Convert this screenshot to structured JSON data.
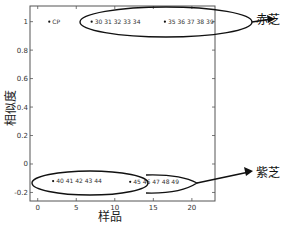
{
  "chart_data": {
    "type": "scatter",
    "title": "",
    "xlabel": "样品",
    "ylabel": "相似度",
    "xlim": [
      -1,
      23
    ],
    "ylim": [
      -0.26,
      1.11
    ],
    "xticks": [
      0,
      5,
      10,
      15,
      20
    ],
    "yticks": [
      -0.2,
      0,
      0.2,
      0.4,
      0.6,
      0.8,
      1
    ],
    "ytick_labels": [
      "-0.2",
      "0",
      "0.2",
      "0.4",
      "0.6",
      "0.8",
      "1"
    ],
    "grid": false,
    "legend": null,
    "points": [
      {
        "x": 1.5,
        "y": 1.0,
        "label": "CP"
      },
      {
        "x": 7,
        "y": 1.0,
        "label": "30 31 32 33 34"
      },
      {
        "x": 16.5,
        "y": 1.0,
        "label": "35 36 37 38 39"
      },
      {
        "x": 2,
        "y": -0.12,
        "label": "40 41 42 43 44"
      },
      {
        "x": 12,
        "y": -0.125,
        "label": "45 46 47 48 49"
      }
    ],
    "groups": [
      {
        "name": "赤芝",
        "members": [
          "30",
          "31",
          "32",
          "33",
          "34",
          "35",
          "36",
          "37",
          "38",
          "39"
        ],
        "y": 1.0
      },
      {
        "name": "紫芝",
        "members": [
          "40",
          "41",
          "42",
          "43",
          "44",
          "45",
          "46",
          "47",
          "48",
          "49"
        ],
        "y": -0.12
      }
    ],
    "annotations": [
      {
        "text": "赤芝",
        "target": "upper ellipse (samples 30-39)"
      },
      {
        "text": "紫芝",
        "target": "lower ellipse (samples 40-49)"
      }
    ]
  }
}
